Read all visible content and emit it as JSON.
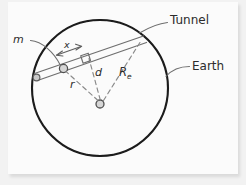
{
  "figure": {
    "type": "diagram",
    "medium": "pencil sketch on white paper",
    "colors": {
      "paper": "#fbfbfb",
      "mat": "#f2f2f2",
      "earth_outline": "#1a1a1a",
      "pencil_light": "#8a8a8a",
      "pencil_mid": "#6d6d6d",
      "label_ink": "#2c2c2c"
    }
  },
  "labels": {
    "mass": "m",
    "displacement": "x",
    "radius_to_mass": "r",
    "perpendicular_distance": "d",
    "earth_radius": "R",
    "earth_radius_subscript": "e",
    "tunnel": "Tunnel",
    "earth": "Earth"
  },
  "geometry": {
    "earth_circle": {
      "cx": 100,
      "cy": 88,
      "r": 68
    },
    "earth_center_dot": {
      "cx": 100,
      "cy": 95,
      "r": 4
    },
    "tunnel": {
      "description": "straight chord drawn as two parallel lines (a band) crossing the upper-left of the circle",
      "entry_point": {
        "x": 37,
        "y": 69
      },
      "exit_point": {
        "x": 142,
        "y": 33
      },
      "band_width_px": 7
    },
    "mass_marker": {
      "cx": 62,
      "cy": 59,
      "r": 4
    },
    "entry_marker": {
      "cx": 37,
      "cy": 69,
      "r": 3.5
    },
    "right_angle_marker": {
      "at": {
        "x": 85,
        "y": 49
      },
      "size_px": 9
    },
    "segments": [
      {
        "name": "r",
        "from": "earth-center",
        "to": "mass",
        "style": "dashed"
      },
      {
        "name": "d",
        "from": "earth-center",
        "to": "tunnel-perpendicular-foot",
        "style": "dashed"
      },
      {
        "name": "Re",
        "from": "earth-center",
        "to": "tunnel-exit-on-circle",
        "style": "dashed"
      }
    ],
    "x_dimension_arrow": {
      "description": "double-headed arrow along the tunnel marking displacement x from the perpendicular foot back to the mass",
      "from": {
        "x": 53,
        "y": 47
      },
      "to": {
        "x": 74,
        "y": 40
      }
    },
    "leaders": [
      {
        "label": "m",
        "from": {
          "x": 26,
          "y": 37
        },
        "to": {
          "x": 60,
          "y": 56
        }
      },
      {
        "label": "Tunnel",
        "from": {
          "x": 166,
          "y": 21
        },
        "to": {
          "x": 134,
          "y": 36
        }
      },
      {
        "label": "Earth",
        "from": {
          "x": 188,
          "y": 65
        },
        "to": {
          "x": 164,
          "y": 71
        }
      }
    ]
  },
  "label_positions": {
    "m": {
      "x": 14,
      "y": 40
    },
    "x": {
      "x": 61,
      "y": 45
    },
    "r": {
      "x": 70,
      "y": 82
    },
    "d": {
      "x": 96,
      "y": 69
    },
    "R": {
      "x": 120,
      "y": 70
    },
    "tunnel": {
      "x": 170,
      "y": 25
    },
    "earth": {
      "x": 192,
      "y": 70
    }
  }
}
